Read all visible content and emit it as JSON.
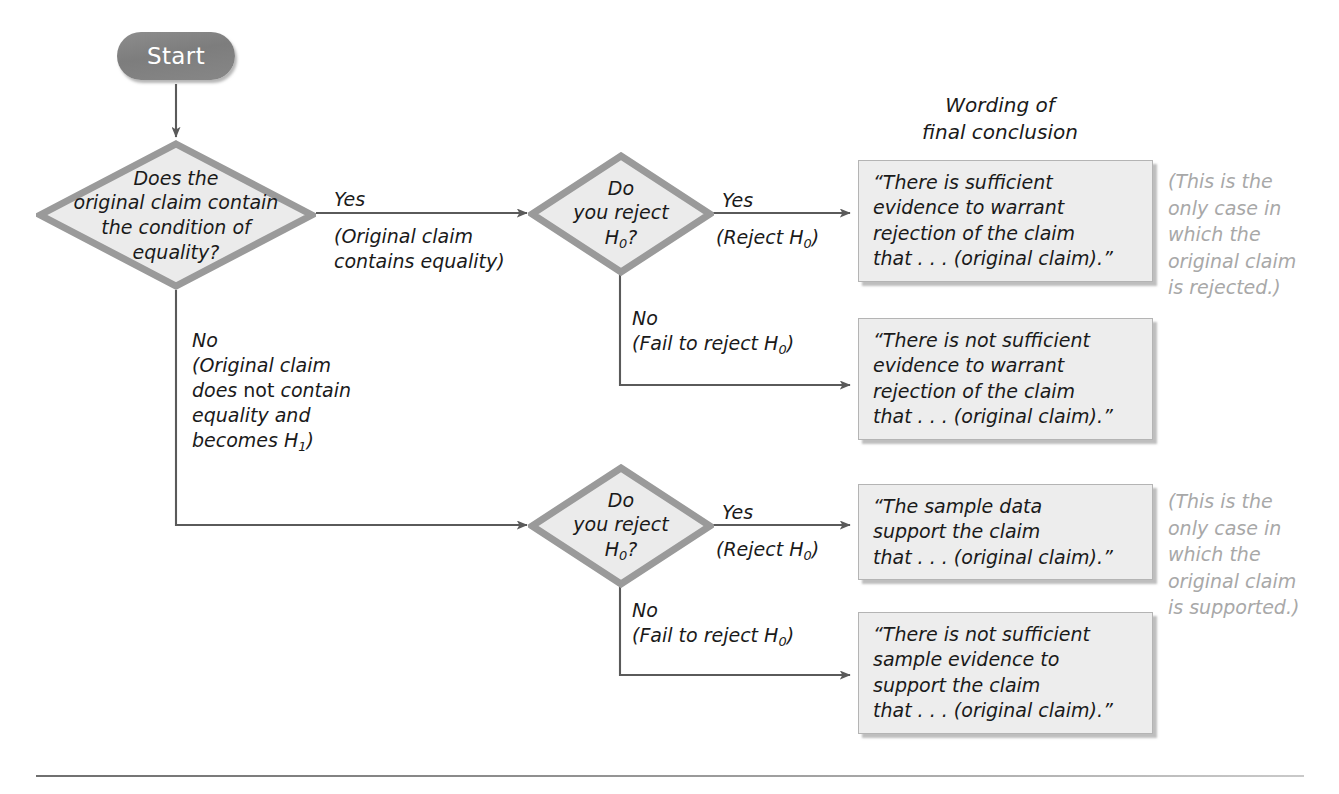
{
  "diagram": {
    "title_caption": {
      "line1": "Wording of",
      "line2": "final conclusion"
    },
    "start": {
      "label": "Start"
    },
    "decision1": {
      "line1": "Does the",
      "line2": "original claim contain",
      "line3": "the condition of",
      "line4": "equality?"
    },
    "decision2": {
      "line1": "Do",
      "line2": "you reject",
      "line3": "H0?"
    },
    "decision3": {
      "line1": "Do",
      "line2": "you reject",
      "line3": "H0?"
    },
    "edges": {
      "yes_equality": {
        "label": "Yes",
        "sub_line1": "(Original claim",
        "sub_line2": "contains equality)"
      },
      "no_equality": {
        "label": "No",
        "sub_line1": "(Original claim",
        "sub_line2": "does not contain",
        "sub_line3": "equality and",
        "sub_line4": "becomes H1)"
      },
      "top_yes_reject": {
        "label": "Yes",
        "sub_line1": "(Reject H0)"
      },
      "top_no_reject": {
        "label": "No",
        "sub_line1": "(Fail to reject H0)"
      },
      "bottom_yes_reject": {
        "label": "Yes",
        "sub_line1": "(Reject H0)"
      },
      "bottom_no_reject": {
        "label": "No",
        "sub_line1": "(Fail to reject H0)"
      }
    },
    "conclusions": [
      {
        "line1": "“There is sufficient",
        "line2": "evidence to warrant",
        "line3": "rejection of the claim",
        "line4": "that . . . (original claim).”"
      },
      {
        "line1": "“There is not sufficient",
        "line2": "evidence to warrant",
        "line3": "rejection of the claim",
        "line4": "that . . . (original claim).”"
      },
      {
        "line1": "“The sample data",
        "line2": "support the claim",
        "line3": "that . . . (original claim).”"
      },
      {
        "line1": "“There is not sufficient",
        "line2": "sample evidence to",
        "line3": "support the claim",
        "line4": "that . . . (original claim).”"
      }
    ],
    "side_notes": [
      {
        "line1": "(This is the",
        "line2": "only case in",
        "line3": "which the",
        "line4": "original claim",
        "line5": "is rejected.)"
      },
      {
        "line1": "(This is the",
        "line2": "only case in",
        "line3": "which the",
        "line4": "original claim",
        "line5": "is supported.)"
      }
    ],
    "colors": {
      "start_fill": "#7d7d7d",
      "start_text": "#ffffff",
      "diamond_fill": "#ebebeb",
      "diamond_stroke": "#9a9a9a",
      "box_fill": "#ededed",
      "box_border": "#b4b4b4",
      "connector": "#5a5a5a",
      "note_text": "#a8a8a8",
      "body_text": "#1a1a1a"
    }
  }
}
